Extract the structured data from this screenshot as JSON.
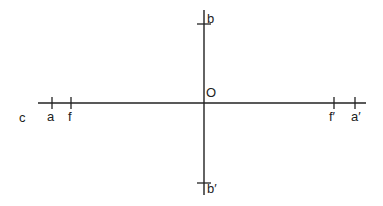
{
  "diagram": {
    "type": "optical-axes",
    "colors": {
      "line": "#222222",
      "text": "#222222",
      "background": "#ffffff"
    },
    "origin": {
      "label": "O"
    },
    "horizontal_axis": {
      "end_label": "c",
      "points": [
        {
          "label": "a"
        },
        {
          "label": "f"
        },
        {
          "label": "f′"
        },
        {
          "label": "a′"
        }
      ]
    },
    "vertical_axis": {
      "points": [
        {
          "label": "b"
        },
        {
          "label": "b′"
        }
      ]
    }
  }
}
